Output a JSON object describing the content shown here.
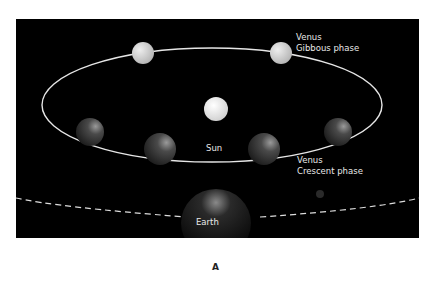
{
  "figure": {
    "letter": "A",
    "labels": {
      "sun": "Sun",
      "earth": "Earth",
      "gibbous_1": "Venus",
      "gibbous_2": "Gibbous phase",
      "crescent_1": "Venus",
      "crescent_2": "Crescent phase"
    },
    "colors": {
      "background": "#000000",
      "orbit": "#e0e0e0",
      "sun": "#f2f2f2"
    }
  }
}
